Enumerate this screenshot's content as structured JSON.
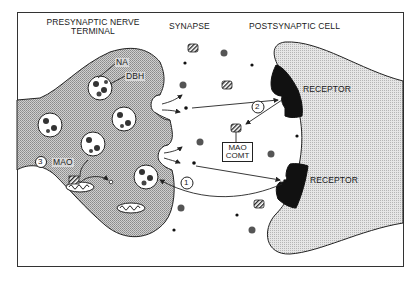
{
  "diagram": {
    "regions": {
      "presynaptic": "PRESYNAPTIC NERVE\nTERMINAL",
      "presynaptic_line1": "PRESYNAPTIC NERVE",
      "presynaptic_line2": "TERMINAL",
      "synapse": "SYNAPSE",
      "postsynaptic": "POSTSYNAPTIC CELL"
    },
    "labels": {
      "na": "NA",
      "dbh": "DBH",
      "mao": "MAO",
      "receptor_top": "RECEPTOR",
      "receptor_bottom": "RECEPTOR",
      "enzyme_box_line1": "MAO",
      "enzyme_box_line2": "COMT"
    },
    "steps": [
      {
        "number": "1",
        "meaning": "reuptake into presynaptic terminal"
      },
      {
        "number": "2",
        "meaning": "extraneuronal metabolism by MAO/COMT"
      },
      {
        "number": "3",
        "meaning": "intraneuronal metabolism by MAO"
      }
    ],
    "colors": {
      "frame": "#333333",
      "presynaptic_fill": "#b8b8b8",
      "postsynaptic_fill": "#d6d6d6",
      "receptor": "#111111",
      "outline": "#222222",
      "background": "#ffffff"
    }
  }
}
